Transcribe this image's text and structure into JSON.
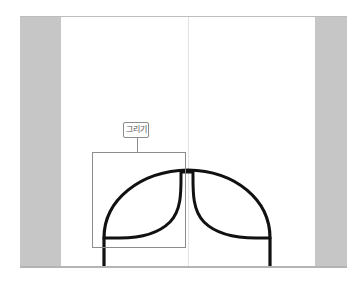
{
  "edge_text": {
    "lines": [
      " ",
      " "
    ]
  },
  "canvas": {
    "frame_color": "#c6c6c6",
    "page_color": "#ffffff",
    "stroke_color": "#111111",
    "guide_color": "#e2e2e2"
  },
  "selection": {
    "label": "그리기",
    "border_color": "#8c8c8c"
  },
  "drawing": {
    "shape": "dome-with-inner-curves",
    "icon": "pen-drawing"
  }
}
